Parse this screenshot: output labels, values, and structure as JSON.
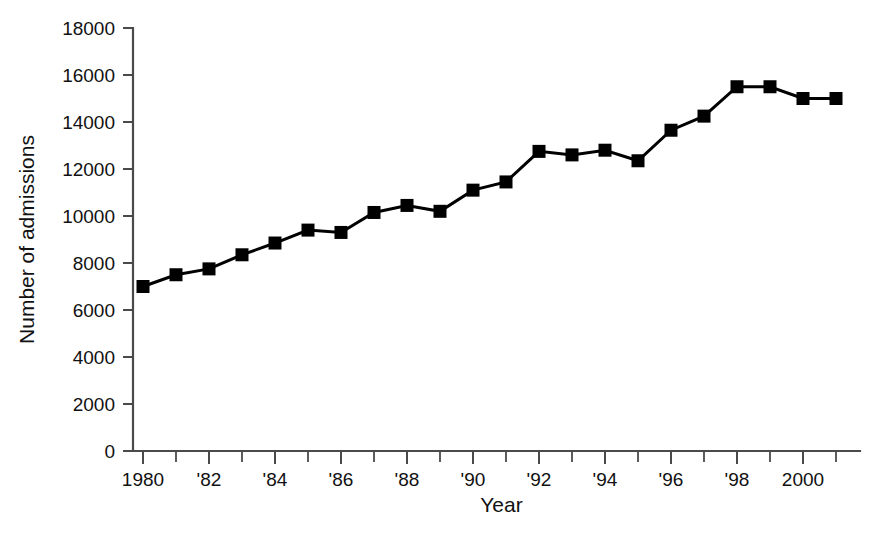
{
  "chart_data": {
    "type": "line",
    "title": "",
    "xlabel": "Year",
    "ylabel": "Number of admissions",
    "x": [
      1980,
      1981,
      1982,
      1983,
      1984,
      1985,
      1986,
      1987,
      1988,
      1989,
      1990,
      1991,
      1992,
      1993,
      1994,
      1995,
      1996,
      1997,
      1998,
      1999,
      2000,
      2001
    ],
    "values": [
      7000,
      7500,
      7750,
      8350,
      8850,
      9400,
      9300,
      10150,
      10450,
      10200,
      11100,
      11450,
      12750,
      12600,
      12800,
      12350,
      13650,
      14250,
      15500,
      15500,
      15000,
      15000
    ],
    "series": [
      {
        "name": "Number of admissions",
        "values": [
          7000,
          7500,
          7750,
          8350,
          8850,
          9400,
          9300,
          10150,
          10450,
          10200,
          11100,
          11450,
          12750,
          12600,
          12800,
          12350,
          13650,
          14250,
          15500,
          15500,
          15000,
          15000
        ],
        "color": "#000000",
        "marker": "square"
      }
    ],
    "xlim": [
      1979.5,
      2001.5
    ],
    "ylim": [
      0,
      18000
    ],
    "ytick_values": [
      0,
      2000,
      4000,
      6000,
      8000,
      10000,
      12000,
      14000,
      16000,
      18000
    ],
    "ytick_labels": [
      "0",
      "2000",
      "4000",
      "6000",
      "8000",
      "10000",
      "12000",
      "14000",
      "16000",
      "18000"
    ],
    "xtick_values": [
      1980,
      1981,
      1982,
      1983,
      1984,
      1985,
      1986,
      1987,
      1988,
      1989,
      1990,
      1991,
      1992,
      1993,
      1994,
      1995,
      1996,
      1997,
      1998,
      1999,
      2000,
      2001
    ],
    "xtick_labels": [
      "1980",
      "",
      "'82",
      "",
      "'84",
      "",
      "'86",
      "",
      "'88",
      "",
      "'90",
      "",
      "'92",
      "",
      "'94",
      "",
      "'96",
      "",
      "'98",
      "",
      "2000",
      ""
    ],
    "grid": false,
    "legend": false,
    "legend_position": "none",
    "axis_color": "#4a4a4a",
    "background": "#ffffff",
    "annotations": []
  }
}
